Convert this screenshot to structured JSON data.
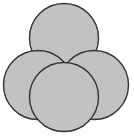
{
  "figure": {
    "width": 134,
    "height": 136,
    "background_color": "#ffffff",
    "shape_count": 4
  },
  "style": {
    "fill_color": "#c2c2c2",
    "stroke_color": "#333333",
    "stroke_width": 1.4
  },
  "chart_data": {
    "type": "diagram",
    "xlabel": "",
    "ylabel": "",
    "xlim": [
      0,
      134
    ],
    "ylim": [
      0,
      136
    ],
    "grid": false,
    "legend": "none",
    "units": "pixels",
    "shapes": [
      {
        "name": "top-circle",
        "label": "Top circle",
        "shape": "circle",
        "cx": 64,
        "cy": 38,
        "r": 34.5,
        "z": 1,
        "fill": "#c2c2c2",
        "stroke": "#333333"
      },
      {
        "name": "left-circle",
        "label": "Left circle",
        "shape": "circle",
        "cx": 38,
        "cy": 85,
        "r": 34.5,
        "z": 2,
        "fill": "#c2c2c2",
        "stroke": "#333333"
      },
      {
        "name": "right-circle",
        "label": "Right circle",
        "shape": "circle",
        "cx": 94,
        "cy": 85,
        "r": 34.5,
        "z": 3,
        "fill": "#c2c2c2",
        "stroke": "#333333"
      },
      {
        "name": "front-circle",
        "label": "Front circle",
        "shape": "circle",
        "cx": 64,
        "cy": 97,
        "r": 34.5,
        "z": 4,
        "fill": "#c2c2c2",
        "stroke": "#333333"
      }
    ]
  }
}
